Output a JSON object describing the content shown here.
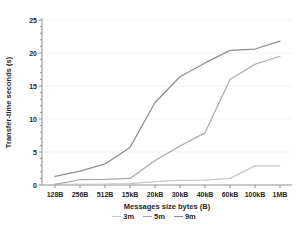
{
  "chart_data": {
    "type": "line",
    "title": "",
    "xlabel": "Messages size bytes (B)",
    "ylabel": "Transfer-time seconds (s)",
    "categories": [
      "128B",
      "256B",
      "512B",
      "15kB",
      "20kB",
      "30kB",
      "40kB",
      "60kB",
      "100kB",
      "1MB"
    ],
    "series": [
      {
        "name": "3m",
        "color": "#c6c6c6",
        "values": [
          0.1,
          0.1,
          0.15,
          0.2,
          0.5,
          0.7,
          0.75,
          1.0,
          2.9,
          2.9
        ]
      },
      {
        "name": "5m",
        "color": "#a8a8a8",
        "values": [
          0.1,
          0.8,
          0.85,
          1.0,
          3.7,
          5.9,
          7.9,
          16.0,
          18.3,
          19.5
        ]
      },
      {
        "name": "9m",
        "color": "#8c8c8c",
        "values": [
          1.3,
          2.1,
          3.2,
          5.7,
          12.5,
          16.4,
          18.5,
          20.4,
          20.6,
          21.8
        ]
      }
    ],
    "ylim": [
      0,
      25
    ],
    "y_major_ticks": [
      0,
      5,
      10,
      15,
      20,
      25
    ],
    "y_minor_step": 1,
    "grid": "faint-horizontal-major",
    "legend_position": "bottom"
  },
  "style": {
    "axis_color": "#8f8f8f",
    "gridline_color": "#f3f3f3",
    "text_color": "#262626",
    "background": "#ffffff"
  }
}
